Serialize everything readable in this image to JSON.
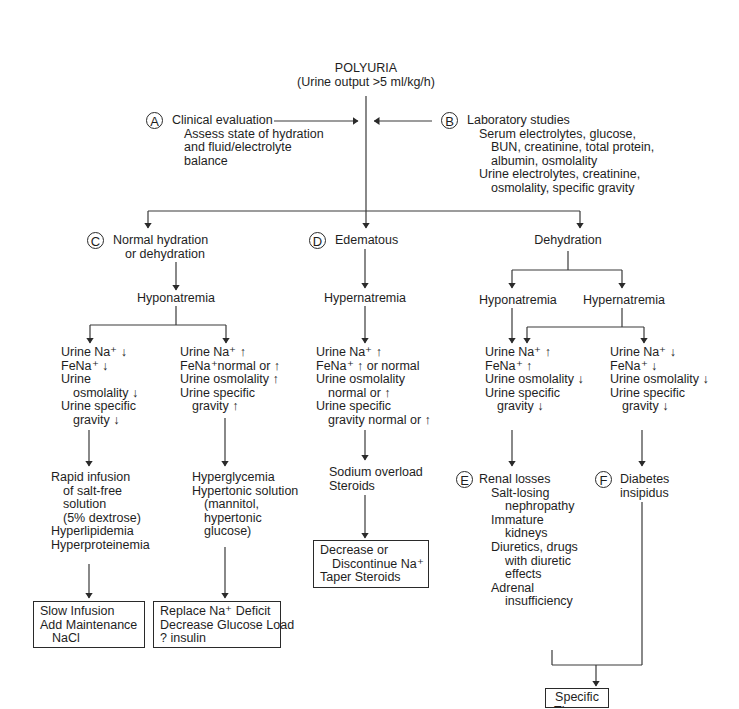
{
  "title": {
    "main": "POLYURIA",
    "subtitle": "(Urine output >5 ml/kg/h)"
  },
  "nodes": {
    "A": {
      "marker": "A",
      "heading": "Clinical evaluation",
      "lines": [
        "Assess state of hydration",
        "and fluid/electrolyte",
        "balance"
      ]
    },
    "B": {
      "marker": "B",
      "heading": "Laboratory studies",
      "lines": [
        "Serum electrolytes, glucose,",
        "BUN, creatinine, total protein,",
        "albumin, osmolality",
        "Urine electrolytes, creatinine,",
        "osmolality, specific gravity"
      ]
    },
    "C": {
      "marker": "C",
      "heading": "Normal hydration",
      "heading2": "or dehydration",
      "sodium": "Hyponatremia",
      "left_labs": [
        "Urine Na⁺ ↓",
        "FeNa⁺ ↓",
        "Urine",
        "osmolality ↓",
        "Urine specific",
        "gravity ↓"
      ],
      "right_labs": [
        "Urine Na⁺ ↑",
        "FeNa⁺normal or ↑",
        "Urine osmolality ↑",
        "Urine specific",
        "gravity ↑"
      ],
      "left_causes": [
        "Rapid infusion",
        "of salt-free",
        "solution",
        "(5% dextrose)",
        "Hyperlipidemia",
        "Hyperproteinemia"
      ],
      "right_causes": [
        "Hyperglycemia",
        "Hypertonic solution",
        "(mannitol,",
        "hypertonic",
        "glucose)"
      ],
      "left_treatment": [
        "Slow Infusion",
        "Add Maintenance",
        "NaCl"
      ],
      "right_treatment": [
        "Replace Na⁺ Deficit",
        "Decrease Glucose Load",
        "? insulin"
      ]
    },
    "D": {
      "marker": "D",
      "heading": "Edematous",
      "sodium": "Hypernatremia",
      "labs": [
        "Urine Na⁺ ↑",
        "FeNa⁺ ↑ or normal",
        "Urine osmolality",
        "normal or ↑",
        "Urine specific",
        "gravity normal or ↑"
      ],
      "causes": [
        "Sodium overload",
        "Steroids"
      ],
      "treatment": [
        "Decrease or",
        "Discontinue Na⁺",
        "Taper Steroids"
      ]
    },
    "dehydration": {
      "heading": "Dehydration",
      "hypo": "Hyponatremia",
      "hyper": "Hypernatremia",
      "left_labs": [
        "Urine Na⁺ ↑",
        "FeNa⁺ ↑",
        "Urine osmolality ↓",
        "Urine specific",
        "gravity ↓"
      ],
      "right_labs": [
        "Urine Na⁺ ↓",
        "FeNa⁺ ↓",
        "Urine osmolality ↓",
        "Urine specific",
        "gravity ↓"
      ]
    },
    "E": {
      "marker": "E",
      "heading": "Renal losses",
      "lines": [
        "Salt-losing",
        "nephropathy",
        "Immature",
        "kidneys",
        "Diuretics, drugs",
        "with diuretic",
        "effects",
        "Adrenal",
        "insufficiency"
      ]
    },
    "F": {
      "marker": "F",
      "lines": [
        "Diabetes",
        "insipidus"
      ]
    },
    "final": {
      "lines": [
        "Specific",
        "Therapy"
      ]
    }
  }
}
